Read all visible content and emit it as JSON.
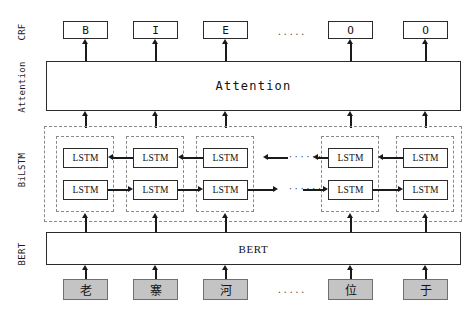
{
  "figure": {
    "layers": [
      {
        "id": "crf",
        "label": "CRF"
      },
      {
        "id": "attention",
        "label": "Attention"
      },
      {
        "id": "bilstm",
        "label": "BiLSTM"
      },
      {
        "id": "bert",
        "label": "BERT"
      }
    ]
  },
  "crf": {
    "layer_label": "CRF",
    "tags": [
      {
        "value": "B"
      },
      {
        "value": "I"
      },
      {
        "value": "E"
      },
      {
        "value": "O"
      },
      {
        "value": "O"
      }
    ],
    "ellipsis": "....."
  },
  "attention": {
    "layer_label": "Attention",
    "band_label": "Attention"
  },
  "bilstm": {
    "layer_label": "BiLSTM",
    "cell_label": "LSTM",
    "backward_row": {
      "direction": "right-to-left",
      "cells": [
        "LSTM",
        "LSTM",
        "LSTM",
        "LSTM",
        "LSTM"
      ],
      "ellipsis": "······"
    },
    "forward_row": {
      "direction": "left-to-right",
      "cells": [
        "LSTM",
        "LSTM",
        "LSTM",
        "LSTM",
        "LSTM"
      ],
      "ellipsis": "······"
    }
  },
  "bert": {
    "layer_label": "BERT",
    "band_label": "BERT"
  },
  "input": {
    "tokens": [
      {
        "char": "老"
      },
      {
        "char": "寨"
      },
      {
        "char": "河"
      },
      {
        "char": "位"
      },
      {
        "char": "于"
      }
    ],
    "ellipsis": "....."
  },
  "colors": {
    "stroke": "#2b2b2b",
    "arrow": "#1a1a1a",
    "dashed": "#8a8a8a",
    "token_fill": "#c4c4c4",
    "background": "#ffffff"
  }
}
